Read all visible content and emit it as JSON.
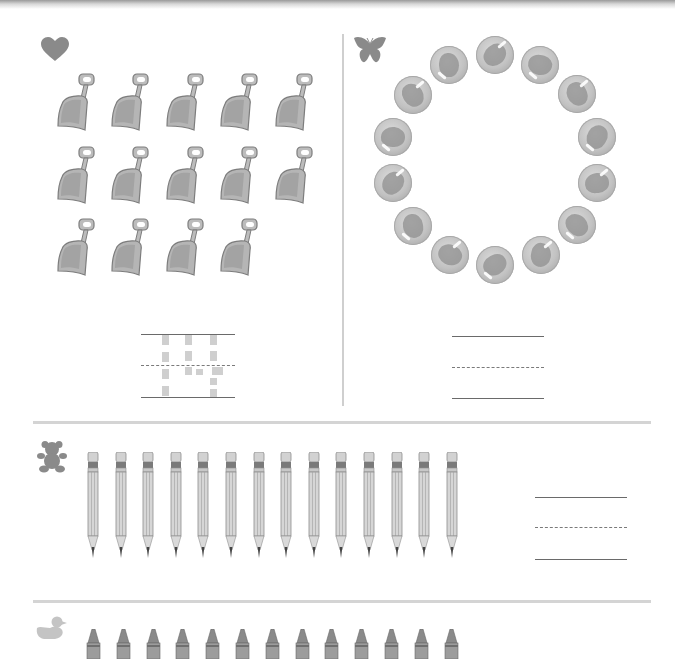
{
  "worksheet": {
    "type": "counting worksheet",
    "sections": [
      {
        "id": "shovels",
        "icon": "heart-icon",
        "item": "shovel",
        "count": 14,
        "rows": [
          5,
          5,
          4
        ],
        "answer_traced": "14"
      },
      {
        "id": "marbles",
        "icon": "butterfly-icon",
        "item": "marble",
        "count": 14,
        "arrangement": "circle",
        "answer_traced": ""
      },
      {
        "id": "pencils",
        "icon": "teddy-bear-icon",
        "item": "pencil",
        "count": 14,
        "answer_traced": ""
      },
      {
        "id": "crayons",
        "icon": "duck-icon",
        "item": "crayon",
        "count": 13,
        "answer_traced": ""
      }
    ]
  },
  "colors": {
    "icon": "#8a8a8a",
    "item_fill": "#bcbcbc",
    "item_outline": "#7d7d7d",
    "divider": "#d4d4d4",
    "writing_line": "#6a6a6a",
    "trace": "#cfcfcf"
  }
}
